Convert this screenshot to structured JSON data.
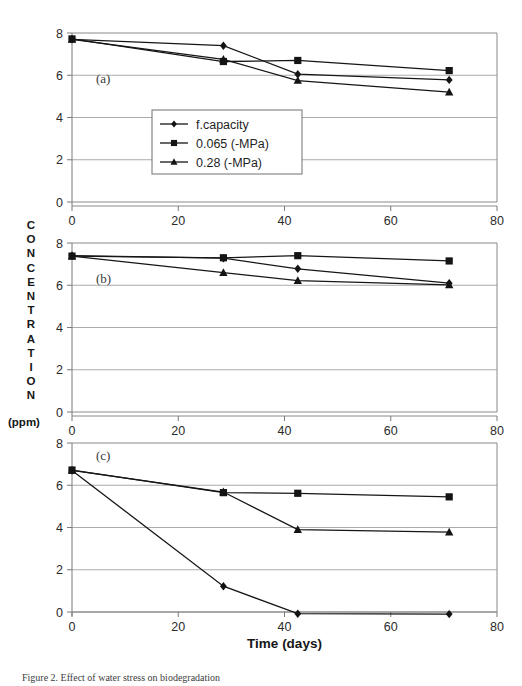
{
  "figure": {
    "caption": "Figure 2. Effect of water stress on biodegradation",
    "ylabel_letters": [
      "C",
      "O",
      "N",
      "C",
      "E",
      "N",
      "T",
      "R",
      "A",
      "T",
      "I",
      "O",
      "N"
    ],
    "ylabel_units": "(ppm)",
    "xlabel": "Time (days)"
  },
  "legend": {
    "position": "inside-panel-a",
    "entries": [
      {
        "label": "f.capacity",
        "marker": "diamond"
      },
      {
        "label": "0.065 (-MPa)",
        "marker": "square"
      },
      {
        "label": "0.28 (-MPa)",
        "marker": "triangle"
      }
    ]
  },
  "chart_data": [
    {
      "type": "line",
      "title": "(a)",
      "panel": "a",
      "xlabel": "Time (days)",
      "ylabel": "CONCENTRATION (ppm)",
      "xlim": [
        0,
        80
      ],
      "ylim": [
        0,
        8
      ],
      "xticks": [
        0,
        20,
        40,
        60,
        80
      ],
      "yticks": [
        0,
        2,
        4,
        6,
        8
      ],
      "grid": true,
      "x": [
        0,
        28.5,
        42.5,
        71
      ],
      "series": [
        {
          "name": "f.capacity",
          "marker": "diamond",
          "values": [
            7.7,
            7.4,
            6.05,
            5.78
          ]
        },
        {
          "name": "0.065 (-MPa)",
          "marker": "square",
          "values": [
            7.72,
            6.65,
            6.7,
            6.22
          ]
        },
        {
          "name": "0.28 (-MPa)",
          "marker": "triangle",
          "values": [
            7.7,
            6.75,
            5.75,
            5.2
          ]
        }
      ]
    },
    {
      "type": "line",
      "title": "(b)",
      "panel": "b",
      "xlabel": "Time (days)",
      "ylabel": "CONCENTRATION (ppm)",
      "xlim": [
        0,
        80
      ],
      "ylim": [
        0,
        8
      ],
      "xticks": [
        0,
        20,
        40,
        60,
        80
      ],
      "yticks": [
        0,
        2,
        4,
        6,
        8
      ],
      "grid": true,
      "x": [
        0,
        28.5,
        42.5,
        71
      ],
      "series": [
        {
          "name": "f.capacity",
          "marker": "diamond",
          "values": [
            7.4,
            7.28,
            6.78,
            6.1
          ]
        },
        {
          "name": "0.065 (-MPa)",
          "marker": "square",
          "values": [
            7.38,
            7.3,
            7.4,
            7.15
          ]
        },
        {
          "name": "0.28 (-MPa)",
          "marker": "triangle",
          "values": [
            7.38,
            6.6,
            6.22,
            6.02
          ]
        }
      ]
    },
    {
      "type": "line",
      "title": "(c)",
      "panel": "c",
      "xlabel": "Time (days)",
      "ylabel": "CONCENTRATION (ppm)",
      "xlim": [
        0,
        80
      ],
      "ylim": [
        0,
        8
      ],
      "xticks": [
        0,
        20,
        40,
        60,
        80
      ],
      "yticks": [
        0,
        2,
        4,
        6,
        8
      ],
      "grid": true,
      "x": [
        0,
        28.5,
        42.5,
        71
      ],
      "series": [
        {
          "name": "f.capacity",
          "marker": "diamond",
          "values": [
            6.7,
            1.22,
            -0.08,
            -0.1
          ]
        },
        {
          "name": "0.065 (-MPa)",
          "marker": "square",
          "values": [
            6.72,
            5.65,
            5.62,
            5.45
          ]
        },
        {
          "name": "0.28 (-MPa)",
          "marker": "triangle",
          "values": [
            6.7,
            5.68,
            3.9,
            3.78
          ]
        }
      ]
    }
  ],
  "style": {
    "line_color": "#1a1a1a",
    "grid_color": "#a8a8a8",
    "axis_color": "#6e6e6e",
    "text_color": "#2b2b2b"
  }
}
